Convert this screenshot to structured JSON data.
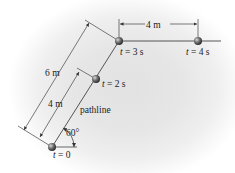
{
  "diagram": {
    "type": "particle-pathline",
    "angle_label": "60°",
    "pathline_label": "pathline",
    "dimensions": {
      "outer_diagonal": "6 m",
      "inner_diagonal": "4 m",
      "horizontal": "4 m"
    },
    "points": [
      {
        "t_var": "t",
        "eq": " = 0"
      },
      {
        "t_var": "t",
        "eq": " = 2 s"
      },
      {
        "t_var": "t",
        "eq": " = 3 s"
      },
      {
        "t_var": "t",
        "eq": " = 4 s"
      }
    ],
    "colors": {
      "line": "#333333",
      "ball": "#6a6a6a",
      "background": "#e4e4e4"
    }
  }
}
